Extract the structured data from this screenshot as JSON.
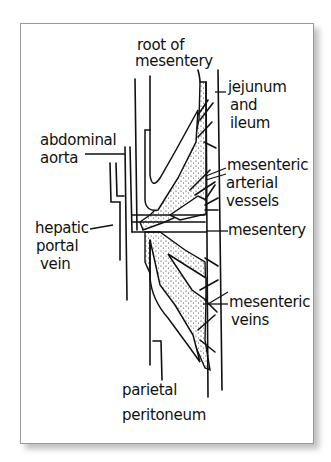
{
  "figure": {
    "type": "hand-drawn anatomical diagram"
  },
  "labels": {
    "root_of_mesentery": [
      "root of",
      "mesentery"
    ],
    "jejunum_and_ileum": [
      "jejunum",
      "and",
      "ileum"
    ],
    "abdominal_aorta": [
      "abdominal",
      "aorta"
    ],
    "mesenteric_arterial_vessels": [
      "mesenteric",
      "arterial",
      "vessels"
    ],
    "hepatic_portal_vein": [
      "hepatic",
      "portal",
      "vein"
    ],
    "mesentery": [
      "mesentery"
    ],
    "mesenteric_veins": [
      "mesenteric",
      "veins"
    ],
    "parietal_peritoneum": [
      "parietal",
      "peritoneum"
    ]
  },
  "colors": {
    "ink": "#111111",
    "frame_border": "#9a9a9a",
    "background": "#ffffff"
  }
}
